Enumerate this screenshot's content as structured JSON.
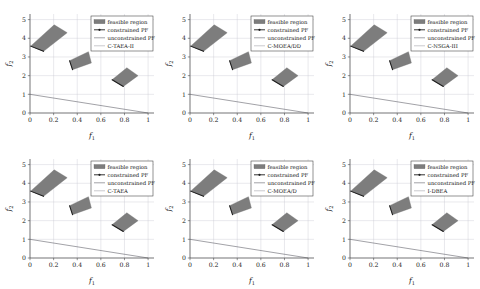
{
  "figure": {
    "rows": 2,
    "cols": 3,
    "background": "#ffffff"
  },
  "axes": {
    "xlabel": "f",
    "xlabel_sub": "1",
    "ylabel": "f",
    "ylabel_sub": "2",
    "xticks": [
      "0",
      "0.2",
      "0.4",
      "0.6",
      "0.8",
      "1"
    ],
    "xtick_values": [
      0,
      0.2,
      0.4,
      0.6,
      0.8,
      1
    ],
    "yticks": [
      "0",
      "1",
      "2",
      "3",
      "4",
      "5"
    ],
    "ytick_values": [
      0,
      1,
      2,
      3,
      4,
      5
    ],
    "xlim": [
      0,
      1.05
    ],
    "ylim": [
      0,
      5.3
    ],
    "grid": true
  },
  "legend": {
    "position": "upper-right",
    "entries": [
      {
        "label": "feasible region",
        "marker": "patch",
        "color": "#7d7d7d"
      },
      {
        "label": "constrained PF",
        "marker": "line-with-dot",
        "color": "#1c1c1c"
      },
      {
        "label": "unconstrained PF",
        "marker": "line",
        "color": "#55555e"
      },
      {
        "label": "algorithm",
        "marker": "line",
        "color": "#9a9aa4"
      }
    ]
  },
  "chart_data": {
    "type": "scatter",
    "title": "",
    "xlabel": "f1",
    "ylabel": "f2",
    "xlim": [
      0,
      1.05
    ],
    "ylim": [
      0,
      5.3
    ],
    "grid": true,
    "legend_position": "upper right",
    "shared_elements": {
      "unconstrained_pf": {
        "name": "unconstrained PF",
        "type": "line",
        "points": [
          [
            0,
            1
          ],
          [
            1,
            0
          ]
        ]
      },
      "feasible_regions": [
        {
          "name": "feasible-region-upper-left",
          "polygon": [
            [
              0.005,
              3.58
            ],
            [
              0.205,
              4.72
            ],
            [
              0.315,
              4.3
            ],
            [
              0.115,
              3.3
            ]
          ],
          "constrained_pf_edge": [
            [
              0.005,
              3.58
            ],
            [
              0.115,
              3.3
            ]
          ]
        },
        {
          "name": "feasible-region-middle",
          "polygon": [
            [
              0.335,
              2.8
            ],
            [
              0.495,
              3.28
            ],
            [
              0.52,
              2.68
            ],
            [
              0.36,
              2.32
            ]
          ],
          "constrained_pf_edge": [
            [
              0.335,
              2.8
            ],
            [
              0.36,
              2.32
            ]
          ]
        },
        {
          "name": "feasible-region-lower-right",
          "polygon": [
            [
              0.695,
              1.78
            ],
            [
              0.82,
              2.42
            ],
            [
              0.915,
              2.0
            ],
            [
              0.79,
              1.42
            ]
          ],
          "constrained_pf_edge": [
            [
              0.695,
              1.78
            ],
            [
              0.79,
              1.42
            ]
          ]
        }
      ]
    },
    "subplots": [
      {
        "index": 0,
        "row": 0,
        "col": 0,
        "algorithm": "C-TAEA-II",
        "legend_labels": [
          "feasible region",
          "constrained PF",
          "unconstrained PF",
          "C-TAEA-II"
        ]
      },
      {
        "index": 1,
        "row": 0,
        "col": 1,
        "algorithm": "C-MOEA/DD",
        "legend_labels": [
          "feasible region",
          "constrained PF",
          "unconstrained PF",
          "C-MOEA/DD"
        ]
      },
      {
        "index": 2,
        "row": 0,
        "col": 2,
        "algorithm": "C-NSGA-III",
        "legend_labels": [
          "feasible region",
          "constrained PF",
          "unconstrained PF",
          "C-NSGA-III"
        ]
      },
      {
        "index": 3,
        "row": 1,
        "col": 0,
        "algorithm": "C-TAEA",
        "legend_labels": [
          "feasible region",
          "constrained PF",
          "unconstrained PF",
          "C-TAEA"
        ]
      },
      {
        "index": 4,
        "row": 1,
        "col": 1,
        "algorithm": "C-MOEA/D",
        "legend_labels": [
          "feasible region",
          "constrained PF",
          "unconstrained PF",
          "C-MOEA/D"
        ]
      },
      {
        "index": 5,
        "row": 1,
        "col": 2,
        "algorithm": "I-DBEA",
        "legend_labels": [
          "feasible region",
          "constrained PF",
          "unconstrained PF",
          "I-DBEA"
        ]
      }
    ]
  }
}
